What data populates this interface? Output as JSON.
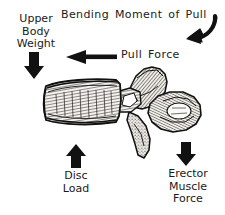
{
  "figure": {
    "title": "Bending Moment of Pull",
    "background_color": "#ffffff",
    "ink_color": "#1a1a1a"
  },
  "labels": {
    "bending_moment": "Bending Moment of Pull",
    "upper_body_weight": [
      "Upper",
      "Body",
      "Weight"
    ],
    "pull_force": "Pull Force",
    "disc_load": [
      "Disc",
      "Load"
    ],
    "erector_muscle_force": [
      "Erector",
      "Muscle",
      "Force"
    ]
  },
  "arrows": [
    {
      "name": "bending-moment-arrow",
      "label": "Bending Moment of Pull",
      "direction": "down-left",
      "style": "thick-curved",
      "color": "#111111"
    },
    {
      "name": "upper-body-weight-arrow",
      "label": "Upper Body Weight",
      "direction": "down",
      "style": "solid-block",
      "color": "#111111"
    },
    {
      "name": "pull-force-arrow",
      "label": "Pull Force",
      "direction": "left",
      "style": "shaft-with-head",
      "color": "#111111"
    },
    {
      "name": "disc-load-arrow",
      "label": "Disc Load",
      "direction": "up",
      "style": "solid-block",
      "color": "#111111"
    },
    {
      "name": "erector-muscle-force-arrow",
      "label": "Erector Muscle Force",
      "direction": "down",
      "style": "solid-block",
      "color": "#111111"
    }
  ],
  "anatomy": {
    "vertebral_body": "vertebral body",
    "spinous_process": "spinous process",
    "superior_articular_process": "superior articular process",
    "transverse_process": "transverse process"
  }
}
